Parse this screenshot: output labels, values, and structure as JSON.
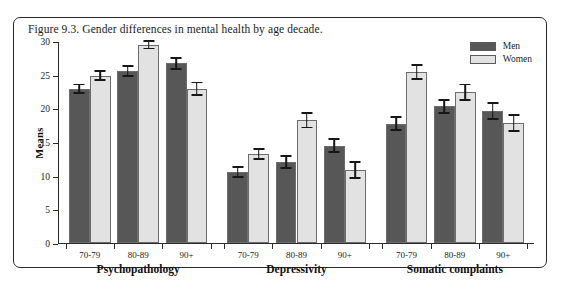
{
  "figure": {
    "caption": "Figure 9.3. Gender differences in mental health by age decade.",
    "border_color": "#2b2b2b"
  },
  "legend": {
    "position": "top-right",
    "entries": [
      {
        "label": "Men",
        "color": "#575757"
      },
      {
        "label": "Women",
        "color": "#e2e2e2"
      }
    ]
  },
  "chart_data": {
    "type": "bar",
    "title": "Figure 9.3. Gender differences in mental health by age decade.",
    "xlabel": "",
    "ylabel": "Means",
    "ylim": [
      0,
      30
    ],
    "yticks": [
      0,
      5,
      10,
      15,
      20,
      25,
      30
    ],
    "grid": false,
    "legend_position": "top-right",
    "error_bars": "standard error",
    "groups": [
      "Psychopathology",
      "Depressivity",
      "Somatic complaints"
    ],
    "categories": [
      "70-79",
      "80-89",
      "90+"
    ],
    "series": [
      {
        "name": "Men",
        "color": "#575757",
        "values": {
          "Psychopathology": [
            23.0,
            25.7,
            26.8
          ],
          "Depressivity": [
            10.6,
            12.1,
            14.5
          ],
          "Somatic complaints": [
            17.8,
            20.4,
            19.7
          ]
        },
        "errors": {
          "Psychopathology": [
            0.8,
            0.9,
            1.0
          ],
          "Depressivity": [
            0.9,
            1.0,
            1.1
          ],
          "Somatic complaints": [
            1.1,
            1.1,
            1.3
          ]
        }
      },
      {
        "name": "Women",
        "color": "#e2e2e2",
        "values": {
          "Psychopathology": [
            25.0,
            29.6,
            23.0
          ],
          "Depressivity": [
            13.3,
            18.3,
            10.9
          ],
          "Somatic complaints": [
            25.5,
            22.5,
            17.9
          ]
        },
        "errors": {
          "Psychopathology": [
            0.8,
            0.7,
            1.1
          ],
          "Depressivity": [
            0.9,
            1.2,
            1.3
          ],
          "Somatic complaints": [
            1.2,
            1.3,
            1.3
          ]
        }
      }
    ]
  }
}
